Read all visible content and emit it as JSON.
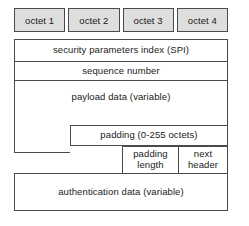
{
  "diagram": {
    "octet_header": {
      "cells": [
        {
          "label": "octet 1"
        },
        {
          "label": "octet 2"
        },
        {
          "label": "octet 3"
        },
        {
          "label": "octet 4"
        }
      ]
    },
    "fields": [
      {
        "id": "spi",
        "label": "security parameters index (SPI)"
      },
      {
        "id": "seq",
        "label": "sequence number"
      },
      {
        "id": "payload",
        "label": "payload data (variable)"
      },
      {
        "id": "padding",
        "label": "padding (0-255 octets)"
      },
      {
        "id": "padlen",
        "label_line1": "padding",
        "label_line2": "length"
      },
      {
        "id": "nexthdr",
        "label_line1": "next",
        "label_line2": "header"
      },
      {
        "id": "auth",
        "label": "authentication data (variable)"
      }
    ],
    "colors": {
      "background": "#ffffff",
      "header_fill": "#dedede",
      "border": "#4a4a4a",
      "text": "#1a1a1a"
    }
  }
}
